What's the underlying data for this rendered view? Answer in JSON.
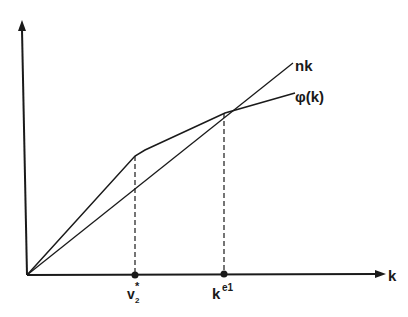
{
  "diagram": {
    "axes": {
      "x_label": "k",
      "y_label": ""
    },
    "curves": [
      {
        "name": "nk",
        "label": "nk"
      },
      {
        "name": "phi",
        "label": "φ(k)"
      }
    ],
    "points": [
      {
        "name": "v2-star",
        "label_base": "v",
        "label_sub": "2",
        "label_sup": "*"
      },
      {
        "name": "k-e1",
        "label_base": "k",
        "label_sup": "e1"
      }
    ],
    "colors": {
      "line": "#1a1a1a",
      "background": "#ffffff"
    }
  }
}
